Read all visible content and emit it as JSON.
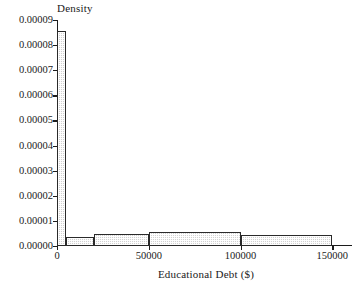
{
  "chart_data": {
    "type": "bar",
    "title": "",
    "subtitle": "",
    "xlabel": "Educational Debt ($)",
    "ylabel": "Density",
    "grid": false,
    "legend": false,
    "legend_position": "none",
    "xlim": [
      0,
      158000
    ],
    "ylim": [
      0.0,
      9e-05
    ],
    "xticks": [
      0,
      50000,
      100000,
      150000
    ],
    "xtick_labels": [
      "0",
      "50000",
      "100000",
      "150000"
    ],
    "yticks": [
      0.0,
      1e-05,
      2e-05,
      3e-05,
      4e-05,
      5e-05,
      6e-05,
      7e-05,
      8e-05,
      9e-05
    ],
    "ytick_labels": [
      "0.00000",
      "0.00001",
      "0.00002",
      "0.00003",
      "0.00004",
      "0.00005",
      "0.00006",
      "0.00007",
      "0.00008",
      "0.00009"
    ],
    "bin_edges": [
      0,
      5000,
      20000,
      50000,
      100000,
      150000
    ],
    "values": [
      8.55e-05,
      3.5e-06,
      4.7e-06,
      5.7e-06,
      4.2e-06
    ],
    "bars": [
      {
        "label": "0-5000",
        "x0": 0,
        "x1": 5000,
        "density": 8.55e-05
      },
      {
        "label": "5000-20000",
        "x0": 5000,
        "x1": 20000,
        "density": 3.5e-06
      },
      {
        "label": "20000-50000",
        "x0": 20000,
        "x1": 50000,
        "density": 4.7e-06
      },
      {
        "label": "50000-100000",
        "x0": 50000,
        "x1": 100000,
        "density": 5.7e-06
      },
      {
        "label": "100000-150000",
        "x0": 100000,
        "x1": 150000,
        "density": 4.2e-06
      }
    ],
    "bar_fill_color": "#d2d2d2",
    "bar_edge_color": "#2a2a2a",
    "axis_color": "#1c1c1c",
    "background_color": "#ffffff"
  }
}
